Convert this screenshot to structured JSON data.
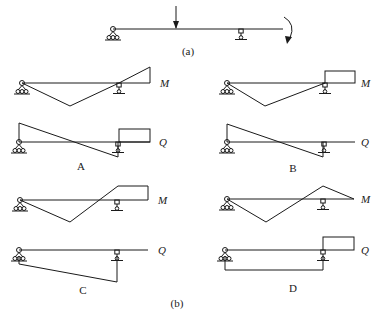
{
  "figure": {
    "part_a_label": "(a)",
    "part_b_label": "(b)",
    "diagram_M_label": "M",
    "diagram_Q_label": "Q",
    "options": [
      {
        "id": "A",
        "label": "A"
      },
      {
        "id": "B",
        "label": "B"
      },
      {
        "id": "C",
        "label": "C"
      },
      {
        "id": "D",
        "label": "D"
      }
    ]
  },
  "beam": {
    "supports": [
      "pin-support",
      "roller-support"
    ],
    "loads": [
      "concentrated-force-downward",
      "clockwise-moment-at-overhang-end"
    ]
  },
  "colors": {
    "line": "#1a1a1a",
    "background": "#ffffff"
  }
}
